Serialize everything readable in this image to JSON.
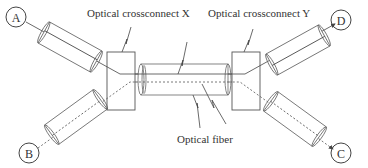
{
  "diagram": {
    "labels": {
      "crossconnect_x": "Optical crossconnect X",
      "crossconnect_y": "Optical crossconnect Y",
      "fiber": "Optical fiber"
    },
    "nodes": {
      "a": "A",
      "b": "B",
      "c": "C",
      "d": "D"
    },
    "colors": {
      "stroke": "#555555",
      "text": "#333333",
      "background": "#ffffff"
    }
  }
}
